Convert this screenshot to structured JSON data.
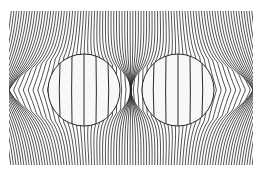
{
  "diagram": {
    "background": "#ffffff",
    "line_color": "#2a2a2a",
    "field_area": {
      "x": 9,
      "y": 11,
      "width": 244,
      "height": 154
    },
    "circles": [
      {
        "name": "left-circle",
        "cx": 84,
        "cy": 90,
        "r": 36,
        "fill": "#f8f8f8"
      },
      {
        "name": "right-circle",
        "cx": 178,
        "cy": 90,
        "r": 36,
        "fill": "#f8f8f8"
      }
    ],
    "inner_lines_per_circle": 5,
    "outer_line_spacing": 2.6
  }
}
